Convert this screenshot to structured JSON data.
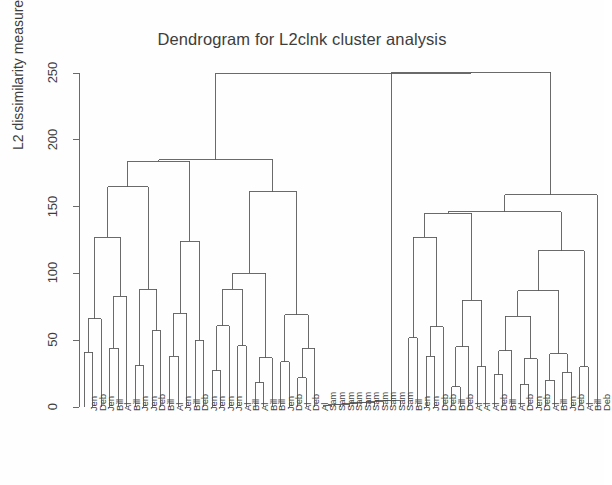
{
  "chart_data": {
    "type": "dendrogram",
    "title": "Dendrogram for L2clnk cluster analysis",
    "xlabel": "",
    "ylabel": "L2 dissimilarity measure",
    "ylim": [
      0,
      250
    ],
    "yticks": [
      0,
      50,
      100,
      150,
      200,
      250
    ],
    "ytick_labels": [
      "0",
      "50",
      "100",
      "150",
      "200",
      "250"
    ],
    "grid": false,
    "legend": null,
    "n_leaves": 61,
    "leaf_labels": [
      "Jen",
      "Deb",
      "Jen",
      "Bill",
      "Al",
      "Bill",
      "Jen",
      "Jen",
      "Deb",
      "Bill",
      "Al",
      "Jen",
      "Bill",
      "Deb",
      "Jen",
      "Jen",
      "Jen",
      "Jen",
      "Al",
      "Bill",
      "Al",
      "Bill",
      "Bill",
      "Jen",
      "Deb",
      "Al",
      "Deb",
      "Al",
      "Sam",
      "Sam",
      "Sam",
      "Sam",
      "Sam",
      "Sam",
      "Sam",
      "Sam",
      "Sam",
      "Sam",
      "Bill",
      "Jen",
      "Jen",
      "Deb",
      "Deb",
      "Bill",
      "Deb",
      "Al",
      "Al",
      "Al",
      "Deb",
      "Bill",
      "Al",
      "Deb",
      "Jen",
      "Deb",
      "Al",
      "Bill",
      "Jen",
      "Deb",
      "Al",
      "Bill",
      "Deb"
    ],
    "merges": [
      {
        "id": "m1",
        "left": {
          "leaf": 0
        },
        "right": {
          "leaf": 1
        },
        "height": 41
      },
      {
        "id": "m2",
        "left": {
          "node": "m1"
        },
        "right": {
          "leaf": 2
        },
        "height": 66
      },
      {
        "id": "m3",
        "left": {
          "leaf": 3
        },
        "right": {
          "leaf": 4
        },
        "height": 44
      },
      {
        "id": "m4",
        "left": {
          "node": "m3"
        },
        "right": {
          "leaf": 5
        },
        "height": 83
      },
      {
        "id": "m5",
        "left": {
          "node": "m2"
        },
        "right": {
          "node": "m4"
        },
        "height": 127
      },
      {
        "id": "m6",
        "left": {
          "leaf": 6
        },
        "right": {
          "leaf": 7
        },
        "height": 31
      },
      {
        "id": "m7",
        "left": {
          "leaf": 8
        },
        "right": {
          "leaf": 9
        },
        "height": 57
      },
      {
        "id": "m8",
        "left": {
          "node": "m6"
        },
        "right": {
          "node": "m7"
        },
        "height": 88
      },
      {
        "id": "m9",
        "left": {
          "node": "m5"
        },
        "right": {
          "node": "m8"
        },
        "height": 165
      },
      {
        "id": "m10",
        "left": {
          "leaf": 10
        },
        "right": {
          "leaf": 11
        },
        "height": 38
      },
      {
        "id": "m11",
        "left": {
          "node": "m10"
        },
        "right": {
          "leaf": 12
        },
        "height": 70
      },
      {
        "id": "m12",
        "left": {
          "leaf": 13
        },
        "right": {
          "leaf": 14
        },
        "height": 50
      },
      {
        "id": "m13",
        "left": {
          "node": "m11"
        },
        "right": {
          "node": "m12"
        },
        "height": 124
      },
      {
        "id": "m14",
        "left": {
          "node": "m9"
        },
        "right": {
          "node": "m13"
        },
        "height": 184
      },
      {
        "id": "m15",
        "left": {
          "leaf": 15
        },
        "right": {
          "leaf": 16
        },
        "height": 27
      },
      {
        "id": "m16",
        "left": {
          "node": "m15"
        },
        "right": {
          "leaf": 17
        },
        "height": 61
      },
      {
        "id": "m17",
        "left": {
          "leaf": 18
        },
        "right": {
          "leaf": 19
        },
        "height": 46
      },
      {
        "id": "m18",
        "left": {
          "node": "m16"
        },
        "right": {
          "node": "m17"
        },
        "height": 88
      },
      {
        "id": "m19",
        "left": {
          "leaf": 20
        },
        "right": {
          "leaf": 21
        },
        "height": 18
      },
      {
        "id": "m20",
        "left": {
          "node": "m19"
        },
        "right": {
          "leaf": 22
        },
        "height": 37
      },
      {
        "id": "m21",
        "left": {
          "node": "m18"
        },
        "right": {
          "node": "m20"
        },
        "height": 100
      },
      {
        "id": "m22",
        "left": {
          "leaf": 23
        },
        "right": {
          "leaf": 24
        },
        "height": 34
      },
      {
        "id": "m23",
        "left": {
          "leaf": 25
        },
        "right": {
          "leaf": 26
        },
        "height": 22
      },
      {
        "id": "m24",
        "left": {
          "node": "m23"
        },
        "right": {
          "leaf": 27
        },
        "height": 44
      },
      {
        "id": "m25",
        "left": {
          "node": "m22"
        },
        "right": {
          "node": "m24"
        },
        "height": 69
      },
      {
        "id": "m26",
        "left": {
          "node": "m21"
        },
        "right": {
          "node": "m25"
        },
        "height": 161
      },
      {
        "id": "m27",
        "left": {
          "node": "m14"
        },
        "right": {
          "node": "m26"
        },
        "height": 185
      },
      {
        "id": "s1",
        "left": {
          "leaf": 28
        },
        "right": {
          "leaf": 29
        },
        "height": 1
      },
      {
        "id": "s2",
        "left": {
          "node": "s1"
        },
        "right": {
          "leaf": 30
        },
        "height": 1.5
      },
      {
        "id": "s3",
        "left": {
          "node": "s2"
        },
        "right": {
          "leaf": 31
        },
        "height": 2
      },
      {
        "id": "s4",
        "left": {
          "node": "s3"
        },
        "right": {
          "leaf": 32
        },
        "height": 2.5
      },
      {
        "id": "s5",
        "left": {
          "node": "s4"
        },
        "right": {
          "leaf": 33
        },
        "height": 3
      },
      {
        "id": "s6",
        "left": {
          "node": "s5"
        },
        "right": {
          "leaf": 34
        },
        "height": 3.5
      },
      {
        "id": "s7",
        "left": {
          "node": "s6"
        },
        "right": {
          "leaf": 35
        },
        "height": 4
      },
      {
        "id": "s8",
        "left": {
          "node": "s7"
        },
        "right": {
          "leaf": 36
        },
        "height": 4.5
      },
      {
        "id": "s9",
        "left": {
          "node": "s8"
        },
        "right": {
          "leaf": 37
        },
        "height": 5
      },
      {
        "id": "r1",
        "left": {
          "leaf": 38
        },
        "right": {
          "leaf": 39
        },
        "height": 52
      },
      {
        "id": "r2",
        "left": {
          "leaf": 40
        },
        "right": {
          "leaf": 41
        },
        "height": 38
      },
      {
        "id": "r3",
        "left": {
          "node": "r2"
        },
        "right": {
          "leaf": 42
        },
        "height": 60
      },
      {
        "id": "r4",
        "left": {
          "node": "r1"
        },
        "right": {
          "node": "r3"
        },
        "height": 127
      },
      {
        "id": "r5",
        "left": {
          "leaf": 43
        },
        "right": {
          "leaf": 44
        },
        "height": 15
      },
      {
        "id": "r6",
        "left": {
          "node": "r5"
        },
        "right": {
          "leaf": 45
        },
        "height": 45
      },
      {
        "id": "r7",
        "left": {
          "leaf": 46
        },
        "right": {
          "leaf": 47
        },
        "height": 30
      },
      {
        "id": "r8",
        "left": {
          "node": "r6"
        },
        "right": {
          "node": "r7"
        },
        "height": 80
      },
      {
        "id": "r9",
        "left": {
          "node": "r4"
        },
        "right": {
          "node": "r8"
        },
        "height": 145
      },
      {
        "id": "r10",
        "left": {
          "leaf": 48
        },
        "right": {
          "leaf": 49
        },
        "height": 24
      },
      {
        "id": "r11",
        "left": {
          "node": "r10"
        },
        "right": {
          "leaf": 50
        },
        "height": 42
      },
      {
        "id": "r12",
        "left": {
          "leaf": 51
        },
        "right": {
          "leaf": 52
        },
        "height": 17
      },
      {
        "id": "r13",
        "left": {
          "node": "r12"
        },
        "right": {
          "leaf": 53
        },
        "height": 36
      },
      {
        "id": "r14",
        "left": {
          "node": "r11"
        },
        "right": {
          "node": "r13"
        },
        "height": 68
      },
      {
        "id": "r15",
        "left": {
          "leaf": 54
        },
        "right": {
          "leaf": 55
        },
        "height": 20
      },
      {
        "id": "r16",
        "left": {
          "leaf": 56
        },
        "right": {
          "leaf": 57
        },
        "height": 26
      },
      {
        "id": "r17",
        "left": {
          "node": "r15"
        },
        "right": {
          "node": "r16"
        },
        "height": 40
      },
      {
        "id": "r18",
        "left": {
          "node": "r14"
        },
        "right": {
          "node": "r17"
        },
        "height": 87
      },
      {
        "id": "r19",
        "left": {
          "leaf": 58
        },
        "right": {
          "leaf": 59
        },
        "height": 30
      },
      {
        "id": "r20",
        "left": {
          "node": "r18"
        },
        "right": {
          "node": "r19"
        },
        "height": 117
      },
      {
        "id": "r21",
        "left": {
          "node": "r9"
        },
        "right": {
          "node": "r20"
        },
        "height": 146
      },
      {
        "id": "r22",
        "left": {
          "node": "r21"
        },
        "right": {
          "leaf": 60
        },
        "height": 159
      },
      {
        "id": "g1",
        "left": {
          "node": "s9"
        },
        "right": {
          "node": "r22"
        },
        "height": 250.5
      },
      {
        "id": "root",
        "left": {
          "node": "m27"
        },
        "right": {
          "node": "g1"
        },
        "height": 250
      }
    ],
    "root_id": "root",
    "line_color": "#5a5a5a",
    "axis_color": "#5a5a5a",
    "background": "#ffffff"
  },
  "plot_geometry": {
    "axis_x": 79,
    "plot_top_y": 73,
    "baseline_y": 407,
    "leaf_x_start": 84,
    "leaf_spacing": 8.55,
    "tick_len": 6
  }
}
